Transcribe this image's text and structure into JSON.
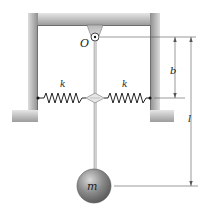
{
  "diagram": {
    "type": "pendulum with two horizontal springs",
    "labels": {
      "pivot": "O",
      "spring_left": "k",
      "spring_right": "k",
      "mass": "m",
      "dim_spring_offset": "b",
      "dim_length": "l"
    },
    "colors": {
      "frame": "#9a9a9a",
      "frame_shadow": "#d4d4d4",
      "spring": "#222222",
      "rod": "#8a8a8a",
      "ball": "#7d7d7d",
      "dimension_line": "#555555"
    }
  }
}
